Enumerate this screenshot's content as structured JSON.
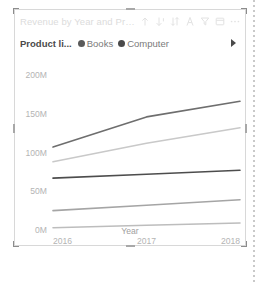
{
  "visual": {
    "title": "Revenue by Year and Produc",
    "header_icons": [
      {
        "name": "drill-up-icon",
        "glyph": "↑"
      },
      {
        "name": "drill-down-icon",
        "glyph": "↓"
      },
      {
        "name": "expand-hierarchy-icon",
        "glyph": "⇅"
      },
      {
        "name": "drill-mode-icon",
        "glyph": "⑂"
      },
      {
        "name": "filter-icon",
        "glyph": "∇"
      },
      {
        "name": "focus-mode-icon",
        "glyph": "⤡"
      },
      {
        "name": "more-options-icon",
        "glyph": "⋯"
      }
    ]
  },
  "legend": {
    "title": "Product li...",
    "next_label": "Next",
    "items": [
      {
        "label": "Books",
        "color": "#5a5a5a"
      },
      {
        "label": "Computer",
        "color": "#4a4a4a"
      }
    ]
  },
  "chart_data": {
    "type": "line",
    "title": "Revenue by Year and Produc",
    "xlabel": "Year",
    "ylabel": "",
    "x": [
      "2016",
      "2017",
      "2018"
    ],
    "xticks": [
      "2016",
      "2017",
      "2018"
    ],
    "yticks": [
      "0M",
      "50M",
      "100M",
      "150M",
      "200M"
    ],
    "ytick_values": [
      0,
      50,
      100,
      150,
      200
    ],
    "ylim": [
      0,
      200
    ],
    "grid": false,
    "legend_position": "top",
    "series": [
      {
        "name": "Series 1",
        "color": "#6e6e6e",
        "values": [
          107,
          146,
          166
        ]
      },
      {
        "name": "Series 2",
        "color": "#c9c9c9",
        "values": [
          88,
          112,
          132
        ]
      },
      {
        "name": "Series 3",
        "color": "#4d4d4d",
        "values": [
          67,
          72,
          77
        ]
      },
      {
        "name": "Series 4",
        "color": "#a5a5a5",
        "values": [
          25,
          32,
          39
        ]
      },
      {
        "name": "Series 5",
        "color": "#bdbdbd",
        "values": [
          3,
          6,
          9
        ]
      }
    ]
  }
}
